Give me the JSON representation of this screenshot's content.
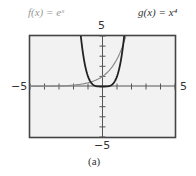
{
  "labels": {
    "f": "f(x) = eˣ",
    "g": "g(x) = x⁴",
    "caption": "(a)"
  },
  "ticks": {
    "ymax": "5",
    "ymin": "−5",
    "xmin": "−5",
    "xmax": "5"
  },
  "colors": {
    "frame": "#444444",
    "f_curve": "#8a8a8a",
    "g_curve": "#222222",
    "plot_bg": "#f2f2f2"
  },
  "chart_data": {
    "type": "line",
    "title": "",
    "xlabel": "",
    "ylabel": "",
    "xlim": [
      -5,
      5
    ],
    "ylim": [
      -5,
      5
    ],
    "xticks_step": 1,
    "yticks_step": 1,
    "grid": false,
    "legend": "labels above plot (f left, g right)",
    "series": [
      {
        "name": "f(x) = e^x",
        "expression": "e^x",
        "x": [
          -5,
          -4,
          -3,
          -2,
          -1,
          0,
          1,
          1.609
        ],
        "y": [
          0.007,
          0.018,
          0.05,
          0.135,
          0.368,
          1,
          2.718,
          5
        ]
      },
      {
        "name": "g(x) = x^4",
        "expression": "x^4",
        "x": [
          -1.495,
          -1.25,
          -1,
          -0.75,
          -0.5,
          0,
          0.5,
          0.75,
          1,
          1.25,
          1.495
        ],
        "y": [
          5,
          2.441,
          1,
          0.316,
          0.0625,
          0,
          0.0625,
          0.316,
          1,
          2.441,
          5
        ]
      }
    ],
    "caption": "(a)"
  }
}
